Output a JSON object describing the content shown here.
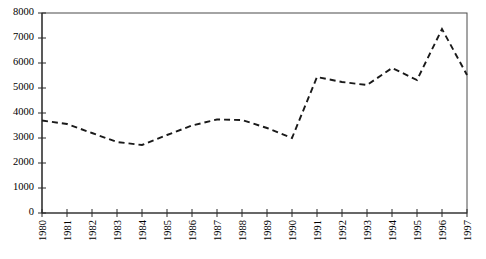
{
  "chart_data": {
    "type": "line",
    "title": "",
    "subtitle": "",
    "xlabel": "",
    "ylabel": "",
    "categories": [
      "1980",
      "1981",
      "1982",
      "1983",
      "1984",
      "1985",
      "1986",
      "1987",
      "1988",
      "1989",
      "1990",
      "1991",
      "1992",
      "1993",
      "1994",
      "1995",
      "1996",
      "1997"
    ],
    "values": [
      3700,
      3560,
      3200,
      2840,
      2720,
      3120,
      3500,
      3740,
      3720,
      3400,
      3000,
      5440,
      5240,
      5120,
      5800,
      5320,
      7360,
      5520
    ],
    "series": [
      {
        "name": "series-1",
        "values": [
          3700,
          3560,
          3200,
          2840,
          2720,
          3120,
          3500,
          3740,
          3720,
          3400,
          3000,
          5440,
          5240,
          5120,
          5800,
          5320,
          7360,
          5520
        ],
        "line_style": "dashed",
        "color": "#1a1a1a",
        "markers": "none"
      }
    ],
    "ylim": [
      0,
      8000
    ],
    "yticks": [
      0,
      1000,
      2000,
      3000,
      4000,
      5000,
      6000,
      7000,
      8000
    ],
    "ytick_labels": [
      "0",
      "1000",
      "2000",
      "3000",
      "4000",
      "5000",
      "6000",
      "7000",
      "8000"
    ],
    "xtick_labels": [
      "1980",
      "1981",
      "1982",
      "1983",
      "1984",
      "1985",
      "1986",
      "1987",
      "1988",
      "1989",
      "1990",
      "1991",
      "1992",
      "1993",
      "1994",
      "1995",
      "1996",
      "1997"
    ],
    "xtick_rotation": 90,
    "grid": false,
    "legend": null,
    "legend_position": "none",
    "annotations": [],
    "axis_color": "#000000",
    "background": "#ffffff"
  },
  "axes": {
    "frame_visible_sides": [
      "left",
      "right",
      "top",
      "bottom"
    ]
  }
}
